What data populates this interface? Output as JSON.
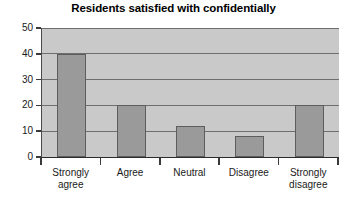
{
  "chart_data": {
    "type": "bar",
    "title": "Residents satisfied with confidentially",
    "categories": [
      "Strongly agree",
      "Agree",
      "Neutral",
      "Disagree",
      "Strongly disagree"
    ],
    "values": [
      40,
      20,
      12,
      8,
      20
    ],
    "xlabel": "",
    "ylabel": "",
    "ylim": [
      0,
      50
    ],
    "yticks": [
      0,
      10,
      20,
      30,
      40,
      50
    ],
    "ytick_labels": [
      "0",
      "10",
      "20",
      "30",
      "40",
      "50"
    ],
    "grid": true,
    "legend": false,
    "series": [
      {
        "name": "Residents",
        "values": [
          40,
          20,
          12,
          8,
          20
        ]
      }
    ],
    "colors": {
      "bar_fill": "#9a9a9a",
      "bar_border": "#5d5d5d",
      "plot_background": "#c9c9c9",
      "gridline": "#6e6e6e",
      "axis": "#2b2b2b",
      "text": "#1a1a1a",
      "figure_background": "#ffffff"
    }
  },
  "x_labels_wrapped": [
    [
      "Strongly",
      "agree"
    ],
    [
      "Agree",
      ""
    ],
    [
      "Neutral",
      ""
    ],
    [
      "Disagree",
      ""
    ],
    [
      "Strongly",
      "disagree"
    ]
  ]
}
